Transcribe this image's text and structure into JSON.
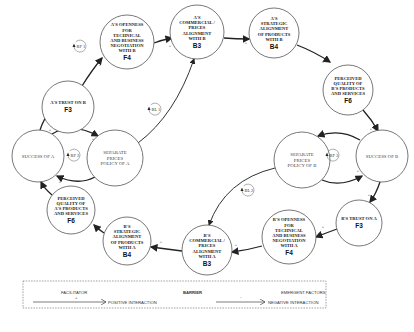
{
  "nodes": [
    {
      "id": "a-trust-on-b",
      "lines": [
        "A'S TRUST ON B"
      ],
      "code": "F3",
      "cx": 68,
      "cy": 107,
      "r": 26,
      "style": "bold"
    },
    {
      "id": "a-openness",
      "lines": [
        "A'S OPENNESS",
        "FOR",
        "TECHNICAL",
        "AND BUSINESS",
        "NEGOTIATION",
        "WITH B"
      ],
      "code": "F4",
      "cx": 127,
      "cy": 42,
      "r": 27,
      "style": "bold"
    },
    {
      "id": "a-commercial-alignment",
      "lines": [
        "A'S",
        "COMMERCIAL /",
        "PRICES",
        "ALIGNMENT",
        "WITH B"
      ],
      "code": "B3",
      "cx": 197,
      "cy": 32,
      "r": 27,
      "style": "bold"
    },
    {
      "id": "a-strategic-alignment",
      "lines": [
        "A'S",
        "STRATEGIC",
        "ALIGNMENT",
        "OF PRODUCTS",
        "WITH B"
      ],
      "code": "B4",
      "cx": 274,
      "cy": 33,
      "r": 25,
      "style": "bold"
    },
    {
      "id": "perceived-quality-b",
      "lines": [
        "PERCEIVED",
        "QUALITY OF",
        "B'S PRODUCTS",
        "AND SERVICES"
      ],
      "code": "F6",
      "cx": 348,
      "cy": 90,
      "r": 25,
      "style": "bold"
    },
    {
      "id": "success-of-b",
      "lines": [
        "SUCCESS OF B"
      ],
      "code": "",
      "cx": 382,
      "cy": 156,
      "r": 26,
      "style": "light"
    },
    {
      "id": "separate-prices-b",
      "lines": [
        "SEPARATE",
        "PRICES",
        "POLICY OF B"
      ],
      "code": "",
      "cx": 302,
      "cy": 160,
      "r": 28,
      "style": "light"
    },
    {
      "id": "b-trust-on-a",
      "lines": [
        "B'S TRUST ON A"
      ],
      "code": "F3",
      "cx": 359,
      "cy": 223,
      "r": 23,
      "style": "bold"
    },
    {
      "id": "b-openness",
      "lines": [
        "B'S OPENNESS",
        "FOR",
        "TECHNICAL",
        "AND BUSINESS",
        "NEGOTIATION",
        "WITH A"
      ],
      "code": "F4",
      "cx": 289,
      "cy": 237,
      "r": 27,
      "style": "bold"
    },
    {
      "id": "b-commercial-alignment",
      "lines": [
        "B'S",
        "COMMERCIAL /",
        "PRICES",
        "ALIGNMENT",
        "WITH A"
      ],
      "code": "B3",
      "cx": 207,
      "cy": 250,
      "r": 25,
      "style": "bold"
    },
    {
      "id": "b-strategic-alignment",
      "lines": [
        "B'S",
        "STRATEGIC",
        "ALIGNMENT",
        "OF PRODUCTS",
        "WITH A"
      ],
      "code": "B4",
      "cx": 127,
      "cy": 241,
      "r": 24,
      "style": "bold"
    },
    {
      "id": "perceived-quality-a",
      "lines": [
        "PERCEIVED",
        "QUALITY OF",
        "A'S PRODUCTS",
        "AND SERVICES"
      ],
      "code": "F6",
      "cx": 71,
      "cy": 210,
      "r": 24,
      "style": "bold"
    },
    {
      "id": "success-of-a",
      "lines": [
        "SUCCESS OF A"
      ],
      "code": "",
      "cx": 38,
      "cy": 156,
      "r": 26,
      "style": "light"
    },
    {
      "id": "separate-prices-a",
      "lines": [
        "SEPARATE",
        "PRICES",
        "POLICY OF A"
      ],
      "code": "",
      "cx": 115,
      "cy": 158,
      "r": 28,
      "style": "light"
    }
  ],
  "edges": [
    {
      "from": "success-of-a",
      "to": "a-trust-on-b",
      "d": "M40 130 Q44 118 50 112",
      "sign": "+",
      "sx": 50,
      "sy": 131
    },
    {
      "from": "a-trust-on-b",
      "to": "a-openness",
      "d": "M82 86 Q92 70 102 58",
      "sign": "+",
      "sx": 100,
      "sy": 66
    },
    {
      "from": "a-openness",
      "to": "a-commercial-alignment",
      "d": "M154 43 Q162 40 172 38",
      "sign": "+",
      "sx": 170,
      "sy": 47
    },
    {
      "from": "a-commercial-alignment",
      "to": "a-strategic-alignment",
      "d": "M224 38 Q236 39 249 39",
      "sign": "+",
      "sx": 246,
      "sy": 44
    },
    {
      "from": "a-strategic-alignment",
      "to": "perceived-quality-b",
      "d": "M297 45 Q315 52 330 62",
      "sign": "+",
      "sx": 323,
      "sy": 63
    },
    {
      "from": "perceived-quality-b",
      "to": "success-of-b",
      "d": "M363 110 Q372 120 378 131",
      "sign": "+",
      "sx": 371,
      "sy": 130
    },
    {
      "from": "success-of-b",
      "to": "separate-prices-b",
      "d": "M360 140 Q340 128 318 136",
      "sign": "+",
      "sx": 318,
      "sy": 145
    },
    {
      "from": "separate-prices-b",
      "to": "success-of-b",
      "d": "M322 180 Q340 188 362 176",
      "sign": "+",
      "sx": 358,
      "sy": 172
    },
    {
      "from": "success-of-b",
      "to": "b-trust-on-a",
      "d": "M380 182 Q376 194 370 202",
      "sign": "+",
      "sx": 369,
      "sy": 196
    },
    {
      "from": "b-trust-on-a",
      "to": "b-openness",
      "d": "M337 229 Q326 233 316 237",
      "sign": "+",
      "sx": 323,
      "sy": 228
    },
    {
      "from": "b-openness",
      "to": "b-commercial-alignment",
      "d": "M262 246 Q248 250 232 252",
      "sign": "+",
      "sx": 236,
      "sy": 246
    },
    {
      "from": "b-commercial-alignment",
      "to": "b-strategic-alignment",
      "d": "M182 251 Q166 249 151 247",
      "sign": "+",
      "sx": 161,
      "sy": 243
    },
    {
      "from": "b-strategic-alignment",
      "to": "perceived-quality-a",
      "d": "M104 233 Q98 229 94 225",
      "sign": "+",
      "sx": 100,
      "sy": 227
    },
    {
      "from": "perceived-quality-a",
      "to": "success-of-a",
      "d": "M52 195 Q44 188 41 182",
      "sign": "+",
      "sx": 47,
      "sy": 180
    },
    {
      "from": "success-of-a",
      "to": "separate-prices-a",
      "d": "M52 134 Q72 122 98 136",
      "sign": "+",
      "sx": 93,
      "sy": 140
    },
    {
      "from": "separate-prices-a",
      "to": "success-of-a",
      "d": "M95 177 Q78 186 57 176",
      "sign": "+",
      "sx": 60,
      "sy": 183
    },
    {
      "from": "separate-prices-a",
      "to": "a-commercial-alignment",
      "d": "M138 143 Q175 115 194 59",
      "sign": "-",
      "sx": 190,
      "sy": 70
    },
    {
      "from": "separate-prices-b",
      "to": "b-commercial-alignment",
      "d": "M275 168 Q225 180 209 225",
      "sign": "-",
      "sx": 210,
      "sy": 222
    }
  ],
  "loops": [
    {
      "id": "rf1",
      "label": "RF 1",
      "cx": 80,
      "cy": 46
    },
    {
      "id": "rf2",
      "label": "RF 2",
      "cx": 74,
      "cy": 155
    },
    {
      "id": "bl1",
      "label": "BL 1",
      "cx": 155,
      "cy": 109
    },
    {
      "id": "rf3",
      "label": "RF 3",
      "cx": 333,
      "cy": 155
    },
    {
      "id": "bl2",
      "label": "BL 2",
      "cx": 248,
      "cy": 190
    }
  ],
  "legend": {
    "facilitator_label": "FACILITATOR",
    "barrier_label": "BARRIER",
    "emergent_label": "EMERGENT FACTORS",
    "positive_sign": "+",
    "positive_label": "POSITIVE INTERACTION",
    "negative_sign": "-",
    "negative_label": "NEGATIVE INTERACTION"
  },
  "colors": {
    "stroke": "#222222",
    "node_border": "#555555",
    "background": "#ffffff"
  }
}
